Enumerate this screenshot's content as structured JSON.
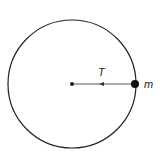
{
  "diagram": {
    "labels": {
      "tension": "T",
      "mass": "m"
    },
    "colors": {
      "stroke": "#222222",
      "background": "#ffffff"
    }
  }
}
